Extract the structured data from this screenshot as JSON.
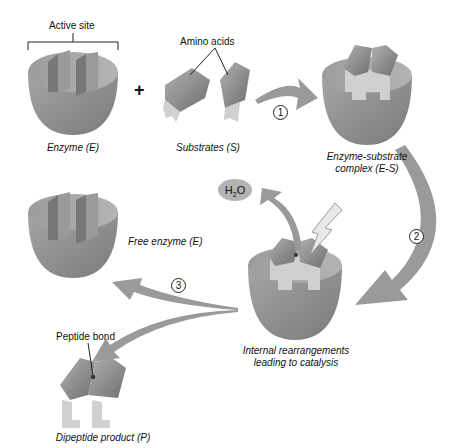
{
  "diagram": {
    "type": "enzyme-catalysis-mechanism",
    "labels": {
      "active_site": "Active site",
      "amino_acids": "Amino acids",
      "plus": "+",
      "enzyme": "Enzyme (E)",
      "substrates": "Substrates (S)",
      "complex_line1": "Enzyme-substrate",
      "complex_line2": "complex (E-S)",
      "water_main": "H",
      "water_sub": "2",
      "water_tail": "O",
      "free_enzyme": "Free enzyme (E)",
      "rearr_line1": "Internal rearrangements",
      "rearr_line2": "leading to catalysis",
      "peptide_bond": "Peptide bond",
      "product": "Dipeptide product (P)"
    },
    "steps": [
      {
        "id": 1,
        "label": "1",
        "symbol": "①",
        "from": "enzyme + substrates",
        "to": "enzyme-substrate complex"
      },
      {
        "id": 2,
        "label": "2",
        "symbol": "②",
        "from": "enzyme-substrate complex",
        "to": "internal rearrangements"
      },
      {
        "id": 3,
        "label": "3",
        "symbol": "③",
        "from": "internal rearrangements",
        "to": "free enzyme + dipeptide product"
      }
    ],
    "colors": {
      "enzyme_body": "#8f8f8f",
      "enzyme_top": "#a8a8a8",
      "amino_acid": "#8a8a8a",
      "substrate_base": "#d0d0d0",
      "arrow": "#9a9a9a",
      "water_bubble": "#b3b3b3"
    }
  }
}
